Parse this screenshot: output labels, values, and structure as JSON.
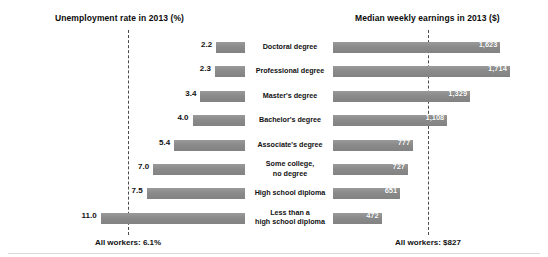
{
  "titles": {
    "left": "Unemployment rate in 2013 (%)",
    "right": "Median weekly earnings in 2013 ($)"
  },
  "footnotes": {
    "left": "All workers: 6.1%",
    "right": "All workers: $827"
  },
  "colors": {
    "bar": "#8d8d8d",
    "ref_line": "#4a4a4a",
    "text": "#111111",
    "value_on_bar": "#ffffff"
  },
  "chart_data": {
    "type": "bar",
    "layout": "bidirectional-tornado",
    "categories": [
      "Doctoral degree",
      "Professional degree",
      "Master's degree",
      "Bachelor's degree",
      "Associate's degree",
      "Some college,\nno degree",
      "High school diploma",
      "Less than a\nhigh school diploma"
    ],
    "series": [
      {
        "name": "Unemployment rate in 2013 (%)",
        "side": "left",
        "unit": "%",
        "values": [
          2.2,
          2.3,
          3.4,
          4.0,
          5.4,
          7.0,
          7.5,
          11.0
        ],
        "labels": [
          "2.2",
          "2.3",
          "3.4",
          "4.0",
          "5.4",
          "7.0",
          "7.5",
          "11.0"
        ],
        "reference_line": {
          "label": "All workers: 6.1%",
          "value": 6.1
        },
        "axis_direction": "right-to-left",
        "max": 12.2
      },
      {
        "name": "Median weekly earnings in 2013 ($)",
        "side": "right",
        "unit": "$",
        "values": [
          1623,
          1714,
          1329,
          1108,
          777,
          727,
          651,
          472
        ],
        "labels": [
          "1,623",
          "1,714",
          "1,329",
          "1,108",
          "777",
          "727",
          "651",
          "472"
        ],
        "reference_line": {
          "label": "All workers: $827",
          "value": 827
        },
        "axis_direction": "left-to-right",
        "max": 1900
      }
    ],
    "grid": false,
    "legend": "none"
  }
}
